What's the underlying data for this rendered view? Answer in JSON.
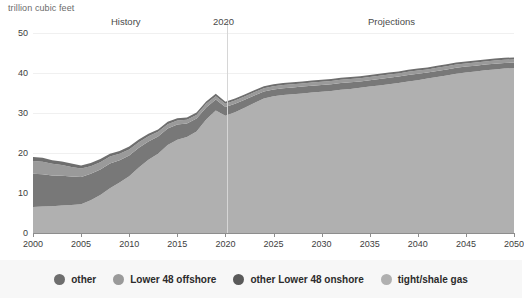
{
  "chart_data": {
    "type": "area",
    "stacked": true,
    "title": "trillion cubic feet",
    "xlabel": "",
    "ylabel": "trillion cubic feet",
    "xlim": [
      2000,
      2050
    ],
    "ylim": [
      0,
      50
    ],
    "grid": true,
    "legend_position": "bottom",
    "x_ticks": [
      2000,
      2005,
      2010,
      2015,
      2020,
      2025,
      2030,
      2035,
      2040,
      2045,
      2050
    ],
    "y_ticks": [
      0,
      10,
      20,
      30,
      40,
      50
    ],
    "annotations": [
      {
        "text": "History",
        "x": 2012
      },
      {
        "text": "2020",
        "x": 2020
      },
      {
        "text": "Projections",
        "x": 2035
      }
    ],
    "divider_x": 2020,
    "x": [
      2000,
      2001,
      2002,
      2003,
      2004,
      2005,
      2006,
      2007,
      2008,
      2009,
      2010,
      2011,
      2012,
      2013,
      2014,
      2015,
      2016,
      2017,
      2018,
      2019,
      2020,
      2021,
      2022,
      2023,
      2024,
      2025,
      2026,
      2027,
      2028,
      2029,
      2030,
      2031,
      2032,
      2033,
      2034,
      2035,
      2036,
      2037,
      2038,
      2039,
      2040,
      2041,
      2042,
      2043,
      2044,
      2045,
      2046,
      2047,
      2048,
      2049,
      2050
    ],
    "series": [
      {
        "name": "tight/shale gas",
        "color": "#b0b0b0",
        "values": [
          6.5,
          6.6,
          6.7,
          6.9,
          7.0,
          7.2,
          8.2,
          9.5,
          11.2,
          12.6,
          14.2,
          16.4,
          18.3,
          19.8,
          22.0,
          23.3,
          24.0,
          25.4,
          28.4,
          30.6,
          29.3,
          30.2,
          31.3,
          32.5,
          33.6,
          34.2,
          34.5,
          34.7,
          34.9,
          35.1,
          35.3,
          35.5,
          35.8,
          36.0,
          36.3,
          36.6,
          36.9,
          37.2,
          37.5,
          37.9,
          38.2,
          38.6,
          39.0,
          39.4,
          39.8,
          40.1,
          40.4,
          40.7,
          40.9,
          41.1,
          41.2
        ]
      },
      {
        "name": "other Lower 48 onshore",
        "color": "#787878",
        "values": [
          8.3,
          8.1,
          7.7,
          7.4,
          7.1,
          6.8,
          6.6,
          6.4,
          6.2,
          5.6,
          5.2,
          4.9,
          4.6,
          4.3,
          4.1,
          3.8,
          3.4,
          3.2,
          3.0,
          2.8,
          2.2,
          2.1,
          2.0,
          1.9,
          1.8,
          1.7,
          1.7,
          1.7,
          1.7,
          1.7,
          1.7,
          1.7,
          1.7,
          1.7,
          1.6,
          1.6,
          1.6,
          1.6,
          1.6,
          1.6,
          1.6,
          1.5,
          1.5,
          1.5,
          1.5,
          1.5,
          1.4,
          1.4,
          1.4,
          1.4,
          1.4
        ]
      },
      {
        "name": "Lower 48 offshore",
        "color": "#9a9a9a",
        "values": [
          3.2,
          3.1,
          2.9,
          2.7,
          2.4,
          2.1,
          1.9,
          1.8,
          1.7,
          1.6,
          1.5,
          1.4,
          1.3,
          1.2,
          1.1,
          1.0,
          0.9,
          0.9,
          0.9,
          0.8,
          0.8,
          0.8,
          0.8,
          0.8,
          0.8,
          0.8,
          0.8,
          0.8,
          0.8,
          0.8,
          0.8,
          0.8,
          0.8,
          0.8,
          0.8,
          0.8,
          0.8,
          0.8,
          0.8,
          0.8,
          0.8,
          0.8,
          0.8,
          0.8,
          0.8,
          0.8,
          0.8,
          0.8,
          0.8,
          0.8,
          0.8
        ]
      },
      {
        "name": "other",
        "color": "#6e6e6e",
        "values": [
          1.0,
          1.0,
          0.9,
          0.9,
          0.9,
          0.8,
          0.8,
          0.8,
          0.7,
          0.7,
          0.7,
          0.7,
          0.6,
          0.6,
          0.6,
          0.6,
          0.6,
          0.6,
          0.6,
          0.6,
          0.5,
          0.5,
          0.5,
          0.5,
          0.5,
          0.5,
          0.5,
          0.5,
          0.5,
          0.5,
          0.5,
          0.5,
          0.5,
          0.5,
          0.5,
          0.5,
          0.5,
          0.5,
          0.5,
          0.5,
          0.5,
          0.5,
          0.5,
          0.5,
          0.5,
          0.5,
          0.5,
          0.5,
          0.5,
          0.5,
          0.5
        ]
      }
    ],
    "legend": [
      {
        "label": "other",
        "color": "#6e6e6e"
      },
      {
        "label": "Lower 48 offshore",
        "color": "#9a9a9a"
      },
      {
        "label": "other Lower 48 onshore",
        "color": "#5a5a5a"
      },
      {
        "label": "tight/shale gas",
        "color": "#b0b0b0"
      }
    ]
  },
  "colors": {
    "background": "#ffffff",
    "legend_background": "#f7f7f7",
    "axis": "#8d8d8d",
    "grid": "#f0f0f0",
    "divider": "#d6d6d6",
    "tick_text": "#3d3d3d",
    "annotation_text": "#4a4a4a",
    "title_text": "#6b6b6b"
  }
}
